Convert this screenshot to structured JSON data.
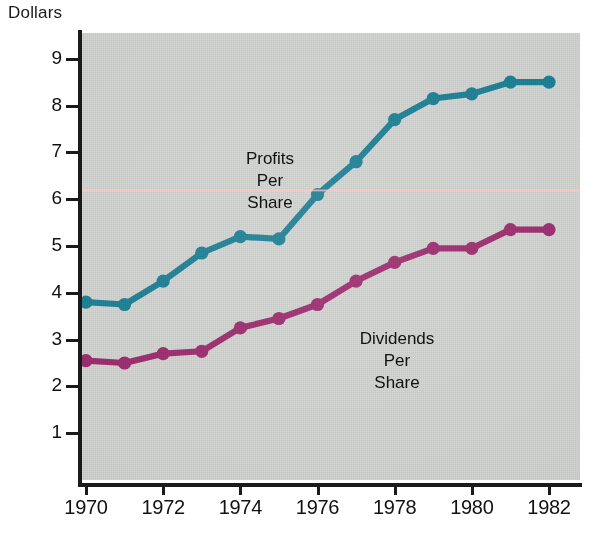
{
  "axis_title": "Dollars",
  "y_axis": {
    "ticks": [
      1,
      2,
      3,
      4,
      5,
      6,
      7,
      8,
      9
    ],
    "labels": [
      "1",
      "2",
      "3",
      "4",
      "5",
      "6",
      "7",
      "8",
      "9"
    ],
    "min": 0,
    "max": 9.55
  },
  "x_axis": {
    "tick_labels": [
      "1970",
      "1972",
      "1974",
      "1976",
      "1978",
      "1980",
      "1982"
    ],
    "tick_values": [
      1970,
      1972,
      1974,
      1976,
      1978,
      1980,
      1982
    ],
    "min": 1970,
    "max": 1982
  },
  "annotations": {
    "profits": {
      "line1": "Profits",
      "line2": "Per",
      "line3": "Share"
    },
    "dividends": {
      "line1": "Dividends",
      "line2": "Per",
      "line3": "Share"
    }
  },
  "colors": {
    "profits": "#1c7f95",
    "dividends": "#9c2c6e",
    "plot_background": "#d2d4d1",
    "axis": "#1a1a1a",
    "text": "#111111",
    "artifact_pink": "#ffc6c6"
  },
  "chart_data": {
    "type": "line",
    "title": "",
    "xlabel": "",
    "ylabel": "Dollars",
    "xlim": [
      1970,
      1982
    ],
    "ylim": [
      0,
      9.55
    ],
    "grid": false,
    "legend": "inline-annotations",
    "x": [
      1970,
      1971,
      1972,
      1973,
      1974,
      1975,
      1976,
      1977,
      1978,
      1979,
      1980,
      1981,
      1982
    ],
    "series": [
      {
        "name": "Profits Per Share",
        "color": "#1c7f95",
        "values": [
          3.8,
          3.75,
          4.25,
          4.85,
          5.2,
          5.15,
          6.1,
          6.8,
          7.7,
          8.15,
          8.25,
          8.5,
          8.5
        ]
      },
      {
        "name": "Dividends Per Share",
        "color": "#9c2c6e",
        "values": [
          2.55,
          2.5,
          2.7,
          2.75,
          3.25,
          3.45,
          3.75,
          4.25,
          4.65,
          4.95,
          4.95,
          5.35,
          5.35
        ]
      }
    ]
  }
}
